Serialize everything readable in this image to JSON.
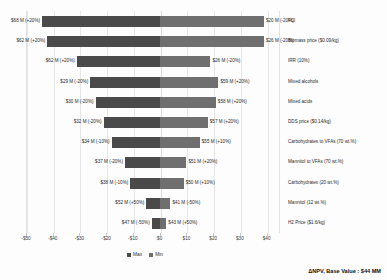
{
  "chart_data": {
    "type": "bar",
    "subtype": "tornado",
    "title": "",
    "xlabel": "",
    "ylabel": "",
    "xlim": [
      -50,
      45
    ],
    "xticks": [
      -50,
      -40,
      -30,
      -20,
      -10,
      0,
      10,
      20,
      30,
      40
    ],
    "xticklabels": [
      "-$50",
      "-$40",
      "-$30",
      "-$20",
      "-$10",
      "$0",
      "$10",
      "$20",
      "$30",
      "$40"
    ],
    "grid": true,
    "legend_position": "bottom-center",
    "legend": [
      "Max",
      "Min"
    ],
    "base_value_note": "ΔNPV, Base Value : $44 MM",
    "categories": [
      "FCI",
      "Biomass price ($0.09/kg)",
      "IRR (10%)",
      "Mixed alcohols",
      "Mixed acids",
      "DDS price ($0.14/kg)",
      "Carbohydrates to VFAs (70 wt.%)",
      "Mannitol to VFAs (70 wt.%)",
      "Carbohydrates (20 wt.%)",
      "Mannitol (12 wt.%)",
      "H2 Price ($1.6/kg)"
    ],
    "rows": [
      {
        "category": "FCI",
        "left_label": "$68 M (+20%)",
        "right_label": "$20 M (-20%)",
        "left_value": -44.0,
        "right_value": 39.0
      },
      {
        "category": "Biomass price ($0.09/kg)",
        "left_label": "$62 M (+20%)",
        "right_label": "$26 M (-20%)",
        "left_value": -42.0,
        "right_value": 39.0
      },
      {
        "category": "IRR (10%)",
        "left_label": "$62 M (+20%)",
        "right_label": "$26 M (-20%)",
        "left_value": -31.0,
        "right_value": 19.0
      },
      {
        "category": "Mixed alcohols",
        "left_label": "$29 M (-20%)",
        "right_label": "$59 M (+20%)",
        "left_value": -26.0,
        "right_value": 22.0
      },
      {
        "category": "Mixed acids",
        "left_label": "$30 M (-20%)",
        "right_label": "$58 M (+20%)",
        "left_value": -24.0,
        "right_value": 21.0
      },
      {
        "category": "DDS price ($0.14/kg)",
        "left_label": "$32 M (-20%)",
        "right_label": "$57 M (+20%)",
        "left_value": -21.0,
        "right_value": 18.0
      },
      {
        "category": "Carbohydrates to VFAs (70 wt.%)",
        "left_label": "$34 M (-10%)",
        "right_label": "$55 M (+10%)",
        "left_value": -18.0,
        "right_value": 15.0
      },
      {
        "category": "Mannitol to VFAs (70 wt.%)",
        "left_label": "$37 M (-20%)",
        "right_label": "$51 M (+20%)",
        "left_value": -13.0,
        "right_value": 10.0
      },
      {
        "category": "Carbohydrates (20 wt.%)",
        "left_label": "$38 M (-10%)",
        "right_label": "$50 M (+10%)",
        "left_value": -11.0,
        "right_value": 9.0
      },
      {
        "category": "Mannitol (12 wt.%)",
        "left_label": "$52 M (+50%)",
        "right_label": "$41 M (-50%)",
        "left_value": -5.0,
        "right_value": 4.0
      },
      {
        "category": "H2 Price ($1.6/kg)",
        "left_label": "$47 M (-50%)",
        "right_label": "$43 M (+50%)",
        "left_value": -3.0,
        "right_value": 2.5
      }
    ]
  },
  "colors": {
    "max_bar": "#4a4a4a",
    "min_bar": "#6f6f6f",
    "grid": "#e6e6e6",
    "background": "#fdfdfd",
    "text": "#2b2b2b"
  }
}
